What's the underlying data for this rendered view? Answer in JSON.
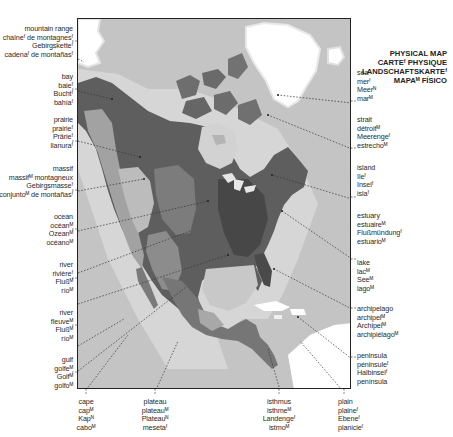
{
  "title": {
    "lines": [
      "PHYSICAL MAP",
      "CARTEᶠ PHYSIQUE",
      "LANDSCHAFTSKARTEᶠ",
      "MAPAᴹ FÍSICO"
    ]
  },
  "map": {
    "region": "North America",
    "colors": {
      "ocean": "#c4c4c4",
      "shallow": "#dadada",
      "ice": "#ffffff",
      "lowland": "#5a5a5a",
      "upland": "#8a8a8a",
      "highland": "#b8b8b8",
      "frame": "#222222"
    }
  },
  "labels": {
    "left": [
      {
        "id": "mountain-range",
        "lines": [
          "mountain range",
          "chaîneᶠ de montagnesᶠ",
          "Gebirgsketteᶠ",
          "cadenaᶠ de montañasᶠ"
        ]
      },
      {
        "id": "bay",
        "lines": [
          "bay",
          "baieᶠ",
          "Buchtᶠ",
          "bahíaᶠ"
        ]
      },
      {
        "id": "prairie",
        "lines": [
          "prairie",
          "prairieᶠ",
          "Prärieᶠ",
          "llanuraᶠ"
        ]
      },
      {
        "id": "massif",
        "lines": [
          "massif",
          "massifᴹ montagneux",
          "Gebirgsmasseᶠ",
          "conjuntoᴹ de montañasᶠ"
        ]
      },
      {
        "id": "ocean",
        "lines": [
          "ocean",
          "océanᴹ",
          "Ozeanᴹ",
          "océanoᴹ"
        ]
      },
      {
        "id": "river-tributary",
        "lines": [
          "river",
          "rivièreᶠ",
          "Flußᴹ",
          "ríoᴹ"
        ]
      },
      {
        "id": "river-main",
        "lines": [
          "river",
          "fleuveᴹ",
          "Flußᴹ",
          "ríoᴹ"
        ]
      },
      {
        "id": "gulf",
        "lines": [
          "gulf",
          "golfeᴹ",
          "Golfᴹ",
          "golfoᴹ"
        ]
      }
    ],
    "right": [
      {
        "id": "sea",
        "lines": [
          "sea",
          "merᶠ",
          "Meerᴺ",
          "marᴹ"
        ]
      },
      {
        "id": "strait",
        "lines": [
          "strait",
          "détroitᴹ",
          "Meerengeᶠ",
          "estrechoᴹ"
        ]
      },
      {
        "id": "island",
        "lines": [
          "island",
          "îleᶠ",
          "Inselᶠ",
          "islaᶠ"
        ]
      },
      {
        "id": "estuary",
        "lines": [
          "estuary",
          "estuaireᴹ",
          "Flußmündungᶠ",
          "estuarioᴹ"
        ]
      },
      {
        "id": "lake",
        "lines": [
          "lake",
          "lacᴹ",
          "Seeᴹ",
          "lagoᴹ"
        ]
      },
      {
        "id": "archipelago",
        "lines": [
          "archipelago",
          "archipelᴹ",
          "Archipelᴹ",
          "archipiélagoᴹ"
        ]
      },
      {
        "id": "peninsula",
        "lines": [
          "peninsula",
          "péninsuleᶠ",
          "Halbinselᶠ",
          "península"
        ]
      }
    ],
    "bottom": [
      {
        "id": "cape",
        "lines": [
          "cape",
          "capᴹ",
          "Kapᴺ",
          "caboᴹ"
        ]
      },
      {
        "id": "plateau",
        "lines": [
          "plateau",
          "plateauᴹ",
          "Plateauᴺ",
          "mesetaᶠ"
        ]
      },
      {
        "id": "isthmus",
        "lines": [
          "isthmus",
          "isthmeᴹ",
          "Landengeᶠ",
          "istmoᴹ"
        ]
      },
      {
        "id": "plain",
        "lines": [
          "plain",
          "plaineᶠ",
          "Ebeneᶠ",
          "planicieᶠ"
        ]
      }
    ]
  }
}
